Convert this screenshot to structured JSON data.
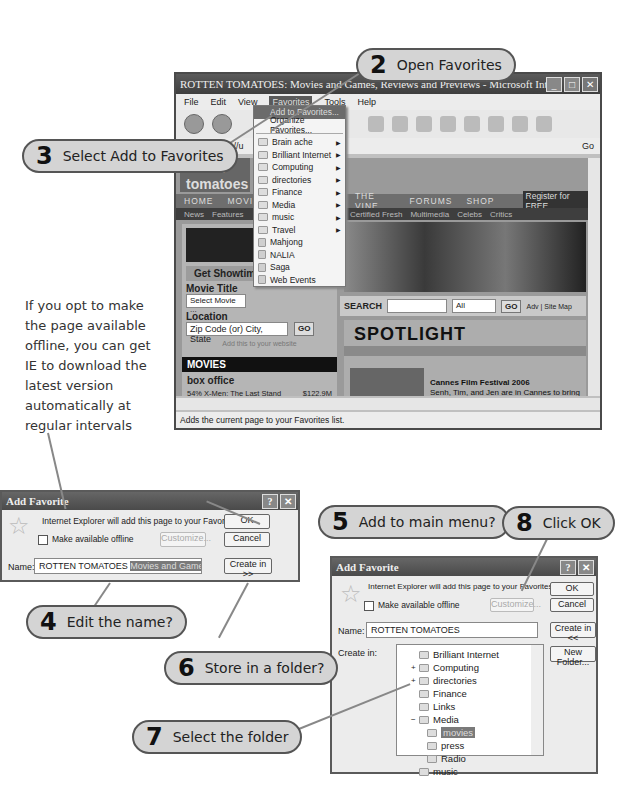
{
  "side_note": "If you opt to make the page available offline, you can get IE to download the latest version automatically at regular intervals",
  "callouts": [
    {
      "num": "2",
      "text": "Open Favorites"
    },
    {
      "num": "3",
      "text": "Select Add to Favorites"
    },
    {
      "num": "4",
      "text": "Edit the name?"
    },
    {
      "num": "5",
      "text": "Add to main menu?"
    },
    {
      "num": "6",
      "text": "Store in a folder?"
    },
    {
      "num": "7",
      "text": "Select the folder"
    },
    {
      "num": "8",
      "text": "Click OK"
    }
  ],
  "browser": {
    "title": "ROTTEN TOMATOES: Movies and Games, Reviews and Previews - Microsoft Internet Explorer pro...",
    "menu": [
      "File",
      "Edit",
      "View",
      "Favorites",
      "Tools",
      "Help"
    ],
    "address": "http://u",
    "go_label": "Go",
    "status": "Adds the current page to your Favorites list.",
    "favorites_menu": {
      "add": "Add to Favorites...",
      "organize": "Organize Favorites...",
      "folders": [
        "Brain ache",
        "Brilliant Internet",
        "Computing",
        "directories",
        "Finance",
        "Media",
        "music",
        "Travel"
      ],
      "links": [
        "Mahjong",
        "NALIA",
        "Saga",
        "Web Events"
      ]
    },
    "site": {
      "logo": "rotten tomatoes",
      "nav": [
        "HOME",
        "MOVIES",
        "THE VINE",
        "FORUMS",
        "SHOP"
      ],
      "register": "Register for FREE",
      "subnav": [
        "News",
        "Features",
        "Trailer",
        "Certified Fresh",
        "Multimedia",
        "Celebs",
        "Critics"
      ],
      "tickets_banner": "TICKETS & SHOWTIMES",
      "get_showtimes": "Get Showtimes",
      "movie_title_label": "Movie Title",
      "movie_select": "Select Movie ...",
      "location_label": "Location",
      "location_placeholder": "Zip Code (or) City, State",
      "go": "GO",
      "add_to_site": "Add this to your website",
      "movies_header": "MOVIES",
      "box_office_title": "box office",
      "box_office": [
        {
          "pct": "54%",
          "title": "X-Men: The Last Stand",
          "gross": "$122.9M"
        },
        {
          "pct": "23%",
          "title": "The Da Vinci Code",
          "gross": "$42.4M"
        },
        {
          "pct": "72%",
          "title": "Over the Hedge",
          "gross": "$35.3M"
        },
        {
          "pct": "70%",
          "title": "Mission: Impossible...",
          "gross": "$8.9M"
        },
        {
          "pct": "29%",
          "title": "Poseidon",
          "gross": "$7.1M"
        }
      ],
      "more": "more...",
      "search_label": "SEARCH",
      "search_scope": "All",
      "search_links": "Adv | Site Map",
      "spotlight": "SPOTLIGHT",
      "spotlight_headline": "Cannes Film Festival 2006",
      "spotlight_body": "Senh, Tim, and Jen are in Cannes to bring you the latest news, reviews, and images from this year's festival. Follow their adventures here."
    }
  },
  "dialog1": {
    "title": "Add Favorite",
    "message": "Internet Explorer will add this page to your Favorites list.",
    "offline_label": "Make available offline",
    "customize": "Customize...",
    "ok": "OK",
    "cancel": "Cancel",
    "name_label": "Name:",
    "name_value_plain": "ROTTEN TOMATOES ",
    "name_value_selected": "Movies and Games, Reviews",
    "name_value_tail": "anc",
    "create_in": "Create in >>"
  },
  "dialog2": {
    "title": "Add Favorite",
    "message": "Internet Explorer will add this page to your Favorites list.",
    "offline_label": "Make available offline",
    "customize": "Customize...",
    "ok": "OK",
    "cancel": "Cancel",
    "name_label": "Name:",
    "name_value": "ROTTEN TOMATOES",
    "create_in": "Create in <<",
    "create_in_label": "Create in:",
    "new_folder": "New Folder...",
    "tree": [
      {
        "label": "Brilliant Internet",
        "indent": 1,
        "expander": ""
      },
      {
        "label": "Computing",
        "indent": 1,
        "expander": "+"
      },
      {
        "label": "directories",
        "indent": 1,
        "expander": "+"
      },
      {
        "label": "Finance",
        "indent": 1,
        "expander": ""
      },
      {
        "label": "Links",
        "indent": 1,
        "expander": ""
      },
      {
        "label": "Media",
        "indent": 1,
        "expander": "−"
      },
      {
        "label": "movies",
        "indent": 2,
        "expander": "",
        "selected": true
      },
      {
        "label": "press",
        "indent": 2,
        "expander": ""
      },
      {
        "label": "Radio",
        "indent": 2,
        "expander": ""
      },
      {
        "label": "music",
        "indent": 1,
        "expander": ""
      }
    ]
  }
}
